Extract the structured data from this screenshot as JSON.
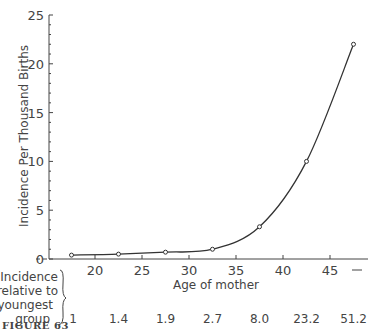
{
  "chart_data": {
    "type": "line",
    "title": "",
    "xlabel": "Age of mother",
    "ylabel": "Incidence Per Thousand Births",
    "x": [
      17.5,
      22.5,
      27.5,
      32.5,
      37.5,
      42.5,
      47.5
    ],
    "series": [
      {
        "name": "Incidence per thousand births",
        "values": [
          0.4,
          0.5,
          0.7,
          1.0,
          3.3,
          10.0,
          22.0
        ]
      }
    ],
    "xticks": [
      "20",
      "25",
      "30",
      "35",
      "40",
      "45",
      "—"
    ],
    "yticks": [
      "0",
      "5",
      "10",
      "15",
      "20",
      "25"
    ],
    "ylim": [
      0,
      25
    ],
    "xlim": [
      15,
      50
    ],
    "grid": false,
    "relative_incidence": {
      "label_lines": [
        "Incidence",
        "relative to",
        "youngest",
        "group"
      ],
      "values": [
        "1",
        "1.4",
        "1.9",
        "2.7",
        "8.0",
        "23.2",
        "51.2"
      ]
    },
    "figure_label": "FIGURE 63"
  }
}
